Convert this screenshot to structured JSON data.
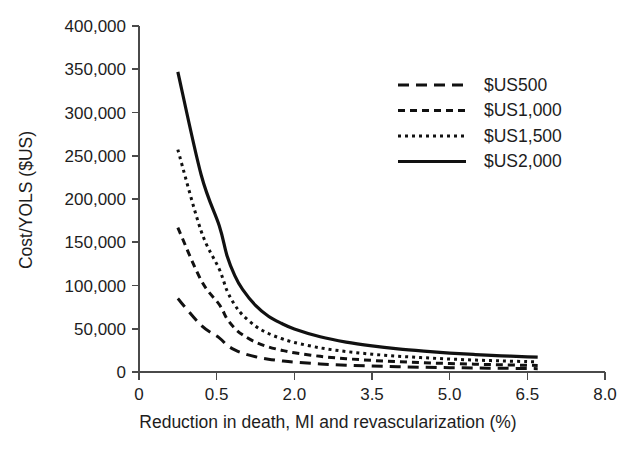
{
  "chart_data": {
    "type": "line",
    "title": "",
    "xlabel": "Reduction in death, MI and revascularization (%)",
    "ylabel": "Cost/YOLS ($US)",
    "xlim": [
      0,
      8.0
    ],
    "ylim": [
      0,
      400000
    ],
    "grid": false,
    "legend_position": "top-right",
    "x_tick_labels": [
      "0",
      "0.5",
      "2.0",
      "3.5",
      "5.0",
      "6.5",
      "8.0"
    ],
    "x_tick_values": [
      0,
      0.5,
      2.0,
      3.5,
      5.0,
      6.5,
      8.0
    ],
    "y_tick_labels": [
      "0",
      "50,000",
      "100,000",
      "150,000",
      "200,000",
      "250,000",
      "300,000",
      "350,000",
      "400,000"
    ],
    "y_tick_values": [
      0,
      50000,
      100000,
      150000,
      200000,
      250000,
      300000,
      350000,
      400000
    ],
    "x": [
      0.25,
      0.4,
      0.55,
      0.7,
      0.85,
      1.0,
      1.25,
      1.5,
      1.75,
      2.0,
      2.5,
      3.0,
      3.5,
      4.0,
      4.5,
      5.0,
      5.5,
      6.0,
      6.5,
      6.7
    ],
    "series": [
      {
        "name": "$US500",
        "dash": "long-dash",
        "stroke_width": 3.0,
        "dasharray": "11,7",
        "values": [
          85000,
          54000,
          39500,
          31000,
          25500,
          21800,
          17600,
          14800,
          12900,
          11400,
          9300,
          7900,
          6900,
          6100,
          5500,
          5000,
          4600,
          4300,
          4000,
          3900
        ]
      },
      {
        "name": "$US1,000",
        "dash": "medium-dash",
        "stroke_width": 3.0,
        "dasharray": "7,5",
        "values": [
          167000,
          106000,
          78000,
          61500,
          50500,
          43000,
          34500,
          29000,
          25200,
          22200,
          18100,
          15400,
          13400,
          11900,
          10700,
          9800,
          9000,
          8300,
          7800,
          7600
        ]
      },
      {
        "name": "$US1,500",
        "dash": "dotted",
        "stroke_width": 3.0,
        "dasharray": "3,4",
        "values": [
          257000,
          163000,
          119000,
          94000,
          77500,
          66000,
          53000,
          44500,
          38700,
          34200,
          27900,
          23700,
          20600,
          18300,
          16500,
          15000,
          13800,
          12800,
          12000,
          11700
        ]
      },
      {
        "name": "$US2,000",
        "dash": "solid",
        "stroke_width": 3.2,
        "dasharray": "",
        "values": [
          347000,
          228000,
          169000,
          134500,
          111500,
          95500,
          77000,
          64500,
          56300,
          49800,
          40700,
          34500,
          30100,
          26700,
          24100,
          21900,
          20200,
          18700,
          17500,
          17100
        ]
      }
    ]
  },
  "legend": {
    "entries": [
      {
        "label": "$US500"
      },
      {
        "label": "$US1,000"
      },
      {
        "label": "$US1,500"
      },
      {
        "label": "$US2,000"
      }
    ]
  },
  "axes": {
    "x_title": "Reduction in death, MI and revascularization (%)",
    "y_title": "Cost/YOLS ($US)"
  },
  "colors": {
    "line": "#111111",
    "axis": "#4a4a4a",
    "text": "#1d1d1d",
    "background": "#ffffff"
  }
}
